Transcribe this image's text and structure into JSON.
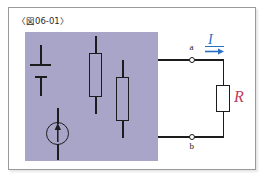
{
  "figure": {
    "caption": "〈図06-01〉",
    "frame_border_color": "#9a9a9a",
    "background": "#ffffff"
  },
  "network_box": {
    "name": "shaded-network-region",
    "fill_color": "#a9a5c9",
    "description": "shaded block containing internal sources and resistors"
  },
  "internal_elements": [
    {
      "type": "battery-cell",
      "symbol": "cell"
    },
    {
      "type": "current-source",
      "symbol": "circle-with-up-arrow"
    },
    {
      "type": "resistor",
      "symbol": "rectangle",
      "position": "upper-middle"
    },
    {
      "type": "resistor",
      "symbol": "rectangle",
      "position": "lower-right"
    }
  ],
  "terminals": [
    {
      "id": "a",
      "label": "a",
      "position": "top"
    },
    {
      "id": "b",
      "label": "b",
      "position": "bottom"
    }
  ],
  "external_load": {
    "label": "R",
    "label_color": "#c23b5a",
    "type": "resistor"
  },
  "current": {
    "label": "I",
    "color": "#2a6fc4",
    "direction": "right",
    "arrow": "arrow-right"
  },
  "colors": {
    "wire": "#1c1c1c",
    "box_fill": "#a9a5c9",
    "current_blue": "#2a6fc4",
    "resistor_red": "#c23b5a",
    "frame_gray": "#9a9a9a"
  }
}
